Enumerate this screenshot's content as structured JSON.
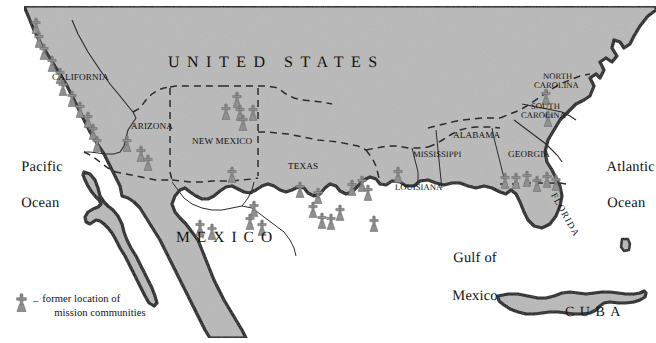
{
  "map": {
    "title_countries": [
      {
        "name": "united-states",
        "label": "UNITED STATES"
      },
      {
        "name": "mexico",
        "label": "MEXICO"
      },
      {
        "name": "cuba",
        "label": "CUBA"
      }
    ],
    "oceans": [
      {
        "name": "pacific-ocean",
        "line1": "Pacific",
        "line2": "Ocean"
      },
      {
        "name": "atlantic-ocean",
        "line1": "Atlantic",
        "line2": "Ocean"
      },
      {
        "name": "gulf-of-mexico",
        "line1": "Gulf of",
        "line2": "Mexico"
      }
    ],
    "states": [
      {
        "name": "california",
        "label": "CALIFORNIA"
      },
      {
        "name": "arizona",
        "label": "ARIZONA"
      },
      {
        "name": "new-mexico",
        "label": "NEW MEXICO"
      },
      {
        "name": "texas",
        "label": "TEXAS"
      },
      {
        "name": "louisiana",
        "label": "LOUISIANA"
      },
      {
        "name": "mississippi",
        "label": "MISSISSIPPI"
      },
      {
        "name": "alabama",
        "label": "ALABAMA"
      },
      {
        "name": "georgia",
        "label": "GEORGIA"
      },
      {
        "name": "florida",
        "label": "FLORIDA"
      },
      {
        "name": "north-carolina-l1",
        "label": "NORTH"
      },
      {
        "name": "north-carolina-l2",
        "label": "CAROLINA"
      },
      {
        "name": "south-carolina-l1",
        "label": "SOUTH"
      },
      {
        "name": "south-carolina-l2",
        "label": "CAROLINA"
      }
    ],
    "legend": {
      "dash": "–",
      "line1": "former location of",
      "line2": "mission communities",
      "symbol_icon": "mission-cross-icon"
    },
    "colors": {
      "land_fill": "#b9b9b9",
      "coastline": "#111111",
      "state_border": "#2b2b2b",
      "mission_symbol": "#8e8e8e",
      "mission_symbol_outline": "#6e6e6e",
      "text": "#14120f",
      "water": "#ffffff"
    },
    "mission_markers": {
      "icon": "mission-cross-icon",
      "count": 44,
      "points": [
        [
          36,
          26
        ],
        [
          39,
          40
        ],
        [
          44,
          52
        ],
        [
          52,
          64
        ],
        [
          60,
          76
        ],
        [
          63,
          88
        ],
        [
          72,
          99
        ],
        [
          80,
          110
        ],
        [
          88,
          120
        ],
        [
          93,
          132
        ],
        [
          97,
          144
        ],
        [
          127,
          144
        ],
        [
          141,
          154
        ],
        [
          148,
          163
        ],
        [
          237,
          100
        ],
        [
          226,
          112
        ],
        [
          240,
          113
        ],
        [
          253,
          113
        ],
        [
          243,
          123
        ],
        [
          232,
          175
        ],
        [
          254,
          209
        ],
        [
          250,
          222
        ],
        [
          262,
          228
        ],
        [
          300,
          190
        ],
        [
          318,
          196
        ],
        [
          313,
          210
        ],
        [
          322,
          221
        ],
        [
          331,
          222
        ],
        [
          340,
          213
        ],
        [
          352,
          188
        ],
        [
          362,
          184
        ],
        [
          368,
          193
        ],
        [
          398,
          175
        ],
        [
          374,
          224
        ],
        [
          505,
          181
        ],
        [
          516,
          181
        ],
        [
          527,
          179
        ],
        [
          537,
          184
        ],
        [
          547,
          180
        ],
        [
          556,
          183
        ],
        [
          546,
          97
        ],
        [
          548,
          119
        ],
        [
          200,
          228
        ],
        [
          212,
          232
        ]
      ]
    }
  }
}
